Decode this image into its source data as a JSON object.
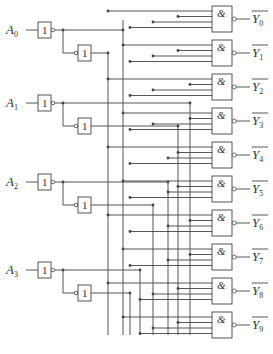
{
  "diagram": {
    "type": "4-to-10 line decoder logic circuit",
    "inputs": [
      {
        "name": "A",
        "sub": "0",
        "y": 30
      },
      {
        "name": "A",
        "sub": "1",
        "y": 103
      },
      {
        "name": "A",
        "sub": "2",
        "y": 182
      },
      {
        "name": "A",
        "sub": "3",
        "y": 270
      }
    ],
    "inverter_symbol": "1",
    "and_symbol": "&",
    "outputs": [
      {
        "name": "Y",
        "sub": "0"
      },
      {
        "name": "Y",
        "sub": "1"
      },
      {
        "name": "Y",
        "sub": "2"
      },
      {
        "name": "Y",
        "sub": "3"
      },
      {
        "name": "Y",
        "sub": "4"
      },
      {
        "name": "Y",
        "sub": "5"
      },
      {
        "name": "Y",
        "sub": "6"
      },
      {
        "name": "Y",
        "sub": "7"
      },
      {
        "name": "Y",
        "sub": "8"
      },
      {
        "name": "Y",
        "sub": "9"
      }
    ],
    "line_color": "#444444"
  }
}
